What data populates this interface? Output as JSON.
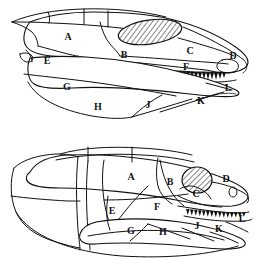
{
  "figure": {
    "name": "skull-lateral-views",
    "background_color": "#ffffff",
    "line_color": "#111111",
    "panels": [
      {
        "id": "upper",
        "name": "upper-skull-diagram",
        "labels": [
          {
            "text": "A",
            "x": 68,
            "y": 38
          },
          {
            "text": "B",
            "x": 124,
            "y": 56
          },
          {
            "text": "C",
            "x": 190,
            "y": 52
          },
          {
            "text": "D",
            "x": 233,
            "y": 57
          },
          {
            "text": "E",
            "x": 47,
            "y": 62
          },
          {
            "text": "F",
            "x": 186,
            "y": 68
          },
          {
            "text": "G",
            "x": 67,
            "y": 88
          },
          {
            "text": "H",
            "x": 98,
            "y": 108
          },
          {
            "text": "J",
            "x": 148,
            "y": 106
          },
          {
            "text": "K",
            "x": 201,
            "y": 102
          },
          {
            "text": "L",
            "x": 228,
            "y": 89
          }
        ]
      },
      {
        "id": "lower",
        "name": "lower-skull-diagram",
        "labels": [
          {
            "text": "A",
            "x": 131,
            "y": 178
          },
          {
            "text": "B",
            "x": 170,
            "y": 183
          },
          {
            "text": "C",
            "x": 196,
            "y": 195
          },
          {
            "text": "D",
            "x": 226,
            "y": 180
          },
          {
            "text": "E",
            "x": 112,
            "y": 212
          },
          {
            "text": "F",
            "x": 157,
            "y": 208
          },
          {
            "text": "G",
            "x": 131,
            "y": 232
          },
          {
            "text": "H",
            "x": 163,
            "y": 233
          },
          {
            "text": "J",
            "x": 197,
            "y": 227
          },
          {
            "text": "K",
            "x": 219,
            "y": 230
          },
          {
            "text": "L",
            "x": 242,
            "y": 220
          }
        ]
      }
    ],
    "features": {
      "hatched_opening": "antorbital-fenestra-hatched",
      "eye_opening": "orbit-opening",
      "teeth": "tooth-row"
    }
  }
}
